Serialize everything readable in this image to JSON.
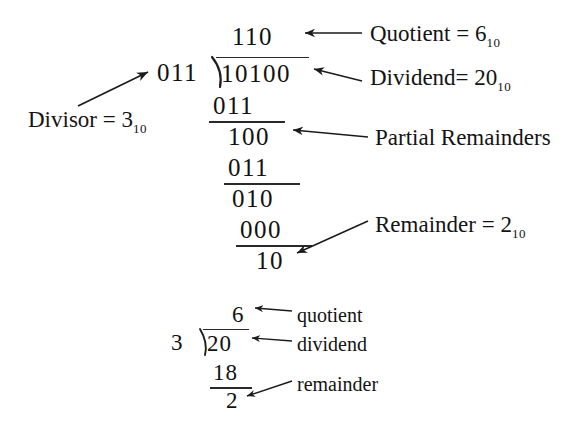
{
  "figure": {
    "background_color": "#ffffff",
    "ink_color": "#141414",
    "top_clipped_text": "p , g"
  },
  "binary_division": {
    "divisor_digits": "011",
    "quotient_digits": "110",
    "dividend_digits": "10100",
    "steps": [
      {
        "name": "subtrahend-1",
        "digits": "011"
      },
      {
        "name": "partial-remainder-1",
        "digits": "100"
      },
      {
        "name": "subtrahend-2",
        "digits": "011"
      },
      {
        "name": "partial-remainder-2",
        "digits": "010"
      },
      {
        "name": "subtrahend-3",
        "digits": "000"
      },
      {
        "name": "final-remainder",
        "digits": "10"
      }
    ],
    "labels": {
      "divisor": "Divisor = 3",
      "divisor_sub": "10",
      "quotient": "Quotient = 6",
      "quotient_sub": "10",
      "dividend": "Dividend= 20",
      "dividend_sub": "10",
      "partial_remainders": "Partial Remainders",
      "remainder": "Remainder = 2",
      "remainder_sub": "10"
    }
  },
  "decimal_division": {
    "divisor": "3",
    "quotient": "6",
    "dividend": "20",
    "subtrahend": "18",
    "remainder": "2",
    "labels": {
      "quotient": "quotient",
      "dividend": "dividend",
      "remainder": "remainder"
    }
  }
}
